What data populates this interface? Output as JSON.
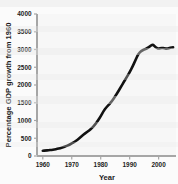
{
  "chart_data": {
    "type": "line",
    "title": "",
    "xlabel": "Year",
    "ylabel": "Percentage GDP growth from 1960",
    "xlim": [
      1958,
      2006
    ],
    "ylim": [
      0,
      4000
    ],
    "xticks": [
      1960,
      1970,
      1980,
      1990,
      2000
    ],
    "xtick_labels": [
      "1960",
      "1970",
      "1980",
      "1990",
      "2000"
    ],
    "yticks": [
      0,
      500,
      1000,
      1500,
      2000,
      2500,
      3000,
      3500,
      4000
    ],
    "ytick_labels": [
      "0",
      "500",
      "1000",
      "1500",
      "2000",
      "2500",
      "3000",
      "3500",
      "4000"
    ],
    "grid": false,
    "legend": null,
    "line_color": "#121212",
    "line_width": 2.6,
    "series": [
      {
        "name": "Percentage GDP growth from 1960",
        "x": [
          1960,
          1961,
          1962,
          1963,
          1964,
          1965,
          1966,
          1967,
          1968,
          1969,
          1970,
          1971,
          1972,
          1973,
          1974,
          1975,
          1976,
          1977,
          1978,
          1979,
          1980,
          1981,
          1982,
          1983,
          1984,
          1985,
          1986,
          1987,
          1988,
          1989,
          1990,
          1991,
          1992,
          1993,
          1994,
          1995,
          1996,
          1997,
          1998,
          1999,
          2000,
          2001,
          2002,
          2003,
          2004,
          2005
        ],
        "values": [
          150,
          155,
          162,
          172,
          185,
          200,
          220,
          245,
          275,
          310,
          350,
          400,
          460,
          530,
          600,
          660,
          720,
          790,
          880,
          990,
          1120,
          1270,
          1380,
          1460,
          1560,
          1680,
          1810,
          1950,
          2090,
          2220,
          2360,
          2520,
          2700,
          2880,
          2960,
          3000,
          3030,
          3090,
          3150,
          3060,
          3020,
          3050,
          3030,
          3020,
          3050,
          3060
        ]
      }
    ]
  },
  "axes": {
    "y_axis_name": "y-axis",
    "x_axis_name": "x-axis"
  }
}
